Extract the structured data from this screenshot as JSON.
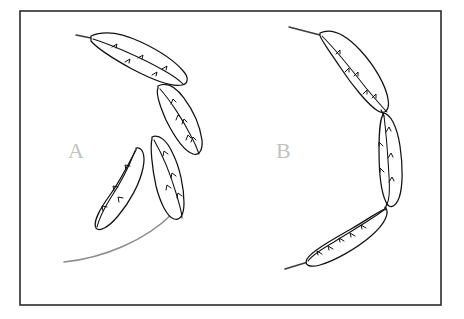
{
  "figure": {
    "width": 464,
    "height": 319,
    "background_color": "#ffffff",
    "frame": {
      "x": 20,
      "y": 11,
      "width": 421,
      "height": 294,
      "stroke_color": "#2b2b2b",
      "stroke_width": 1.6
    },
    "ink_color": "#111111",
    "guide_color": "#8d8d8d",
    "label_color": "#c2c2c2"
  },
  "panels": [
    {
      "id": "panel-a",
      "label": "A",
      "label_x": 68,
      "label_y": 158,
      "description": "Four elongated leaf-shaped (feather-like) outlines arranged in a loose arc, each with a central vein and short barb marks; a grey guide arc sweeps from lower-left upward to the right.",
      "element_count": 4,
      "guide_arc": "M 64 262 C 104 258 146 240 172 214",
      "elements": [
        {
          "name": "leaf-a-1",
          "outline": "M 91 36 C 104 30 122 33 141 42 C 160 51 176 62 184 72 C 189 78 188 84 182 85 C 172 87 153 80 132 69 C 112 58 96 47 91 41 Z",
          "vein": "M 93 39 C 112 45 142 58 163 70 C 174 76 180 81 183 84",
          "barbs": [
            "M 112 47 l 5 -3 l -1 4",
            "M 138 58 l 5 -3 l -1 4",
            "M 162 69 l 5 -3 l -1 4",
            "M 125 62 l 5 -3 l -1 4",
            "M 152 75 l 5 -3 l -1 4"
          ],
          "tail": "M 91 38 L 76 35"
        },
        {
          "name": "leaf-a-2",
          "outline": "M 158 86 C 166 82 175 86 184 98 C 193 110 200 126 202 140 C 203 150 199 156 193 154 C 184 151 174 136 166 120 C 159 104 156 92 158 88 Z",
          "vein": "M 160 89 C 170 100 183 120 191 136 C 196 145 198 151 199 154",
          "barbs": [
            "M 171 104 l 2 -5 l 3 3",
            "M 182 124 l 2 -5 l 3 3",
            "M 191 142 l 2 -5 l 3 3",
            "M 176 120 l 2 -5 l 3 3",
            "M 186 140 l 2 -5 l 3 3"
          ],
          "tail": ""
        },
        {
          "name": "leaf-a-3",
          "outline": "M 152 137 C 159 134 167 140 173 154 C 180 168 184 188 184 203 C 184 215 180 221 174 219 C 167 217 160 202 156 186 C 152 168 150 146 152 139 Z",
          "vein": "M 154 140 C 162 154 171 176 176 193 C 180 206 182 214 182 218",
          "barbs": [
            "M 163 156 l 1 -5 l 4 3",
            "M 171 178 l 1 -5 l 4 3",
            "M 177 198 l 1 -5 l 4 3",
            "M 166 190 l 1 -5 l 4 3"
          ],
          "tail": ""
        },
        {
          "name": "leaf-a-4",
          "outline": "M 136 148 C 142 147 146 154 143 168 C 140 183 130 202 118 216 C 108 228 99 232 96 228 C 93 223 99 210 110 195 C 122 178 132 157 136 150 Z",
          "vein": "M 135 151 C 130 164 120 184 110 199 C 102 212 98 223 97 227",
          "barbs": [
            "M 126 170 l -1 -5 l 5 1",
            "M 114 191 l -1 -5 l 5 1",
            "M 103 211 l -1 -5 l 5 1",
            "M 119 202 l -1 -5 l 5 1"
          ],
          "tail": ""
        }
      ]
    },
    {
      "id": "panel-b",
      "label": "B",
      "label_x": 276,
      "label_y": 158,
      "description": "Three elongated leaf-shaped (feather-like) outlines joined end-to-end forming a continuous C-shaped chain opening to the left; thin rachis tails extend from the top and bottom ends.",
      "element_count": 3,
      "guide_arc": "",
      "elements": [
        {
          "name": "leaf-b-1",
          "outline": "M 320 33 C 331 28 345 34 360 50 C 375 66 386 86 388 99 C 390 110 385 115 378 111 C 368 105 352 85 340 67 C 328 49 319 37 320 35 Z",
          "vein": "M 322 36 C 334 48 352 70 366 88 C 377 101 384 109 387 112",
          "barbs": [
            "M 336 54 l 4 -4 l 0 4",
            "M 354 76 l 4 -4 l 0 4",
            "M 372 98 l 4 -4 l 0 4",
            "M 345 72 l 4 -4 l 0 4",
            "M 363 94 l 4 -4 l 0 4"
          ],
          "tail": "M 320 35 L 289 27"
        },
        {
          "name": "leaf-b-2",
          "outline": "M 383 113 C 390 113 397 126 400 146 C 403 166 403 187 399 198 C 395 208 389 209 386 202 C 381 192 379 170 379 150 C 379 130 381 117 383 115 Z",
          "vein": "M 384 116 C 386 132 388 158 389 176 C 390 192 389 200 387 204",
          "barbs": [
            "M 386 132 l 3 -5 l 2 4",
            "M 388 158 l 3 -5 l 2 4",
            "M 389 182 l 3 -5 l 2 4",
            "M 383 146 l -4 -4 l 0 4",
            "M 384 172 l -4 -4 l 0 4"
          ],
          "tail": ""
        },
        {
          "name": "leaf-b-3",
          "outline": "M 385 207 C 390 212 386 223 371 236 C 356 249 334 261 320 265 C 309 268 304 265 307 259 C 312 251 332 240 351 229 C 370 218 382 209 385 209 Z",
          "vein": "M 384 210 C 372 219 350 232 334 242 C 320 250 311 257 308 261",
          "barbs": [
            "M 366 228 l -5 -3 l 1 4",
            "M 344 241 l -5 -3 l 1 4",
            "M 322 254 l -5 -3 l 1 4",
            "M 355 236 l -5 -3 l 1 4",
            "M 333 249 l -5 -3 l 1 4"
          ],
          "tail": "M 308 262 L 285 269"
        }
      ],
      "joints": [
        "M 381 110 L 384 116",
        "M 387 203 L 385 210"
      ]
    }
  ]
}
